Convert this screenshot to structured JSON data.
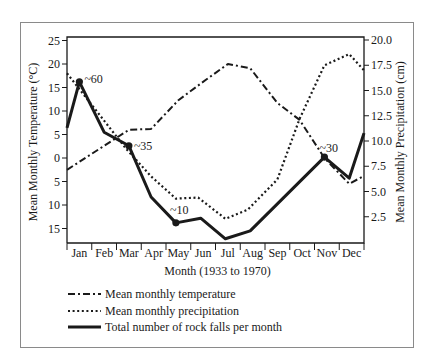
{
  "chart_data": {
    "type": "line",
    "title": "",
    "xlabel": "Month (1933 to 1970)",
    "ylabel_left": "Mean Monthly Temperature (°C)",
    "ylabel_right": "Mean Monthly Precipitation (cm)",
    "categories": [
      "Jan",
      "Feb",
      "Mar",
      "Apr",
      "May",
      "Jun",
      "Jul",
      "Aug",
      "Sep",
      "Oct",
      "Nov",
      "Dec"
    ],
    "left_axis": {
      "ticks": [
        25,
        20,
        15,
        10,
        5,
        0,
        -5,
        -10,
        -15
      ],
      "tick_labels": [
        "25",
        "20",
        "15",
        "10",
        "5",
        "0",
        "5",
        "10",
        "15"
      ],
      "ylim": [
        -18,
        25
      ]
    },
    "right_axis": {
      "ticks": [
        20.0,
        17.5,
        15.0,
        12.5,
        10.0,
        7.5,
        5.0,
        2.5
      ],
      "tick_labels": [
        "20.0",
        "17.5",
        "15.0",
        "12.5",
        "10.0",
        "7.5",
        "5.0",
        "2.5"
      ],
      "ylim": [
        0,
        20.0
      ]
    },
    "grid": false,
    "legend_position": "below",
    "series": [
      {
        "name": "Mean monthly temperature",
        "axis": "left",
        "style": "dashdot",
        "points": [
          {
            "x": 0.0,
            "y": -2.5
          },
          {
            "x": 2.5,
            "y": 6.0
          },
          {
            "x": 3.4,
            "y": 6.2
          },
          {
            "x": 4.5,
            "y": 12.3
          },
          {
            "x": 5.6,
            "y": 16.6
          },
          {
            "x": 6.5,
            "y": 20.0
          },
          {
            "x": 7.4,
            "y": 19.1
          },
          {
            "x": 8.5,
            "y": 11.7
          },
          {
            "x": 9.4,
            "y": 8.1
          },
          {
            "x": 10.4,
            "y": 0.0
          },
          {
            "x": 11.4,
            "y": -5.5
          },
          {
            "x": 12.0,
            "y": -3.8
          }
        ]
      },
      {
        "name": "Mean monthly precipitation",
        "axis": "right",
        "style": "dotted",
        "points": [
          {
            "x": 0.0,
            "y": 16.7
          },
          {
            "x": 2.4,
            "y": 9.2
          },
          {
            "x": 3.4,
            "y": 6.5
          },
          {
            "x": 4.4,
            "y": 4.3
          },
          {
            "x": 5.3,
            "y": 4.4
          },
          {
            "x": 6.4,
            "y": 2.3
          },
          {
            "x": 7.3,
            "y": 3.2
          },
          {
            "x": 8.5,
            "y": 6.2
          },
          {
            "x": 9.4,
            "y": 12.2
          },
          {
            "x": 10.4,
            "y": 17.5
          },
          {
            "x": 11.4,
            "y": 18.6
          },
          {
            "x": 12.0,
            "y": 17.0
          }
        ]
      },
      {
        "name": "Total number of rock falls per month",
        "axis": "left",
        "style": "solid",
        "note": "plotted on left-axis scale; only annotated counts are labeled",
        "points": [
          {
            "x": 0.0,
            "y": 6.4
          },
          {
            "x": 0.5,
            "y": 16.2,
            "marker": true,
            "label": "~60"
          },
          {
            "x": 1.5,
            "y": 5.5
          },
          {
            "x": 2.5,
            "y": 2.6,
            "marker": true,
            "label": "~35"
          },
          {
            "x": 3.4,
            "y": -8.3
          },
          {
            "x": 4.4,
            "y": -13.8,
            "marker": true,
            "label": "~10"
          },
          {
            "x": 5.4,
            "y": -12.8
          },
          {
            "x": 6.4,
            "y": -17.2
          },
          {
            "x": 7.4,
            "y": -15.5
          },
          {
            "x": 10.4,
            "y": 0.2,
            "marker": true,
            "label": "~30"
          },
          {
            "x": 11.4,
            "y": -4.3
          },
          {
            "x": 12.0,
            "y": 5.3
          }
        ]
      }
    ],
    "annotations": [
      {
        "text": "~60",
        "month": "Jan"
      },
      {
        "text": "~35",
        "month": "Mar"
      },
      {
        "text": "~10",
        "month": "May"
      },
      {
        "text": "~30",
        "month": "Nov"
      }
    ],
    "legend": [
      {
        "label": "Mean monthly temperature",
        "style": "dashdot"
      },
      {
        "label": "Mean monthly precipitation",
        "style": "dotted"
      },
      {
        "label": "Total number of rock falls per month",
        "style": "solid"
      }
    ]
  },
  "colors": {
    "ink": "#1a1a1a",
    "frame": "#8a8a8a",
    "background": "#ffffff"
  }
}
